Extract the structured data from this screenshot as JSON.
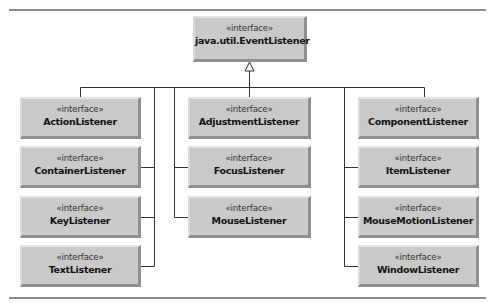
{
  "diagram": {
    "type": "uml-class-hierarchy",
    "root": {
      "stereotype": "«interface»",
      "name": "java.util.EventListener"
    },
    "relationship": "extends (generalization arrow, hollow triangle pointing to root)",
    "columns": [
      {
        "position": "left",
        "children": [
          {
            "stereotype": "«interface»",
            "name": "ActionListener"
          },
          {
            "stereotype": "«interface»",
            "name": "ContainerListener"
          },
          {
            "stereotype": "«interface»",
            "name": "KeyListener"
          },
          {
            "stereotype": "«interface»",
            "name": "TextListener"
          }
        ]
      },
      {
        "position": "middle",
        "children": [
          {
            "stereotype": "«interface»",
            "name": "AdjustmentListener"
          },
          {
            "stereotype": "«interface»",
            "name": "FocusListener"
          },
          {
            "stereotype": "«interface»",
            "name": "MouseListener"
          }
        ]
      },
      {
        "position": "right",
        "children": [
          {
            "stereotype": "«interface»",
            "name": "ComponentListener"
          },
          {
            "stereotype": "«interface»",
            "name": "ItemListener"
          },
          {
            "stereotype": "«interface»",
            "name": "MouseMotionListener"
          },
          {
            "stereotype": "«interface»",
            "name": "WindowListener"
          }
        ]
      }
    ],
    "colors": {
      "box_fill": "#c9c9c9",
      "line": "#333333",
      "rule": "#8a8a8a"
    }
  }
}
